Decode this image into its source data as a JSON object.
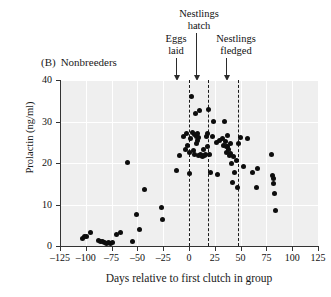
{
  "panel": {
    "id": "(B)",
    "title": "Nonbreeders"
  },
  "annotations": [
    {
      "name": "eggs-laid",
      "label": "Eggs\nlaid",
      "line1": "Eggs",
      "line2": "laid",
      "day": 0
    },
    {
      "name": "nestlings-hatch",
      "label": "Nestlings\nhatch",
      "line1": "Nestlings",
      "line2": "hatch",
      "day": 18
    },
    {
      "name": "nestlings-fledged",
      "label": "Nestlings\nfledged",
      "line1": "Nestlings",
      "line2": "fledged",
      "day": 47
    }
  ],
  "axes": {
    "x": {
      "label": "Days relative to first clutch in group",
      "ticks": [
        -125,
        -100,
        -75,
        -50,
        -25,
        0,
        25,
        50,
        75,
        100,
        125
      ],
      "ticklabels": [
        "–125",
        "–100",
        "–75",
        "–50",
        "–25",
        "0",
        "25",
        "50",
        "75",
        "100",
        "125"
      ],
      "min": -125,
      "max": 125
    },
    "y": {
      "label": "Prolactin (ng/ml)",
      "ticks": [
        0,
        10,
        20,
        30,
        40
      ],
      "ticklabels": [
        "0",
        "10",
        "20",
        "30",
        "40"
      ],
      "min": 0,
      "max": 40
    }
  },
  "style": {
    "plot_background": "#efefef",
    "gridline_color": "#ffffff",
    "point_color": "#0d0d0d",
    "axis_color": "#333333",
    "event_line_color": "#1a1a1a"
  },
  "chart_data": {
    "type": "scatter",
    "xlabel": "Days relative to first clutch in group",
    "ylabel": "Prolactin (ng/ml)",
    "xlim": [
      -125,
      125
    ],
    "ylim": [
      0,
      40
    ],
    "grid": true,
    "legend": null,
    "series": [
      {
        "name": "Nonbreeders",
        "marker": "filled-circle",
        "color": "#0d0d0d",
        "points": [
          [
            -103,
            1.7
          ],
          [
            -101,
            2.4
          ],
          [
            -99,
            2.3
          ],
          [
            -95,
            3.2
          ],
          [
            -88,
            1.3
          ],
          [
            -86,
            1.0
          ],
          [
            -84,
            1.1
          ],
          [
            -82,
            0.8
          ],
          [
            -80,
            0.7
          ],
          [
            -78,
            0.8
          ],
          [
            -76,
            0.7
          ],
          [
            -74,
            0.9
          ],
          [
            -70,
            2.8
          ],
          [
            -66,
            3.3
          ],
          [
            -60,
            20.2
          ],
          [
            -55,
            1.1
          ],
          [
            -51,
            7.5
          ],
          [
            -48,
            3.9
          ],
          [
            -43,
            13.5
          ],
          [
            -27,
            9.2
          ],
          [
            -26,
            6.5
          ],
          [
            -12,
            18.3
          ],
          [
            -9,
            21.7
          ],
          [
            -5,
            26.5
          ],
          [
            -3,
            23.3
          ],
          [
            -2,
            27.2
          ],
          [
            -1,
            24.1
          ],
          [
            0,
            22.6
          ],
          [
            0,
            17.4
          ],
          [
            1,
            25.9
          ],
          [
            2,
            36.1
          ],
          [
            3,
            27.4
          ],
          [
            4,
            23.0
          ],
          [
            5,
            26.8
          ],
          [
            5,
            22.1
          ],
          [
            6,
            31.9
          ],
          [
            7,
            26.5
          ],
          [
            7,
            24.6
          ],
          [
            8,
            27.0
          ],
          [
            8,
            25.4
          ],
          [
            9,
            26.2
          ],
          [
            9,
            21.8
          ],
          [
            10,
            32.6
          ],
          [
            11,
            22.0
          ],
          [
            12,
            21.7
          ],
          [
            13,
            21.6
          ],
          [
            14,
            23.2
          ],
          [
            15,
            21.9
          ],
          [
            16,
            22.0
          ],
          [
            17,
            26.3
          ],
          [
            18,
            27.2
          ],
          [
            18,
            24.0
          ],
          [
            19,
            32.8
          ],
          [
            20,
            22.0
          ],
          [
            21,
            17.8
          ],
          [
            23,
            26.5
          ],
          [
            24,
            29.9
          ],
          [
            27,
            25.0
          ],
          [
            28,
            17.3
          ],
          [
            30,
            25.4
          ],
          [
            32,
            26.0
          ],
          [
            33,
            24.2
          ],
          [
            34,
            30.0
          ],
          [
            35,
            25.1
          ],
          [
            36,
            24.0
          ],
          [
            36,
            22.6
          ],
          [
            37,
            23.9
          ],
          [
            37,
            26.6
          ],
          [
            38,
            23.3
          ],
          [
            39,
            21.9
          ],
          [
            40,
            22.4
          ],
          [
            40,
            24.8
          ],
          [
            41,
            19.8
          ],
          [
            42,
            15.2
          ],
          [
            43,
            21.5
          ],
          [
            44,
            17.8
          ],
          [
            46,
            20.5
          ],
          [
            47,
            14.0
          ],
          [
            48,
            24.6
          ],
          [
            50,
            26.2
          ],
          [
            53,
            19.2
          ],
          [
            57,
            25.9
          ],
          [
            62,
            17.6
          ],
          [
            65,
            14.0
          ],
          [
            66,
            18.6
          ],
          [
            80,
            22.0
          ],
          [
            81,
            17.1
          ],
          [
            82,
            16.2
          ],
          [
            82,
            15.0
          ],
          [
            83,
            12.7
          ],
          [
            84,
            8.6
          ]
        ]
      }
    ],
    "event_markers": [
      {
        "label": "Eggs laid",
        "day": 0,
        "style": "dashed"
      },
      {
        "label": "Nestlings hatch",
        "day": 18,
        "style": "dashed"
      },
      {
        "label": "Nestlings fledged",
        "day": 47,
        "style": "dashed"
      }
    ]
  }
}
